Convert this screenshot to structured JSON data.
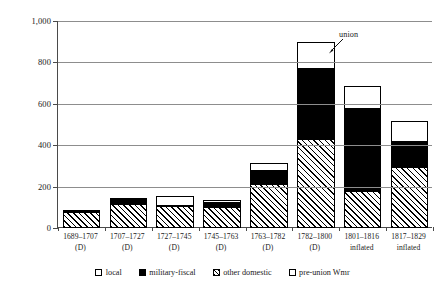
{
  "chart_data": {
    "type": "bar",
    "stacked": true,
    "title": "",
    "xlabel": "",
    "ylabel": "",
    "ylim": [
      0,
      1000
    ],
    "yticks": [
      0,
      200,
      400,
      600,
      800,
      1000
    ],
    "ytick_labels": [
      "0",
      "200",
      "400",
      "600",
      "800",
      "1,000"
    ],
    "grid": true,
    "legend_position": "bottom",
    "categories": [
      "1689–1707",
      "1707–1727",
      "1727–1745",
      "1745–1763",
      "1763–1782",
      "1782–1800",
      "1801–1816",
      "1817–1829"
    ],
    "category_sublabels": [
      "(D)",
      "(D)",
      "(D)",
      "(D)",
      "(D)",
      "(D)",
      "inflated",
      "inflated"
    ],
    "series": [
      {
        "name": "other domestic",
        "fill": "hatch",
        "values": [
          75,
          118,
          105,
          103,
          215,
          430,
          180,
          295
        ]
      },
      {
        "name": "military-fiscal",
        "fill": "black",
        "values": [
          12,
          30,
          13,
          27,
          72,
          350,
          405,
          128
        ]
      },
      {
        "name": "local",
        "fill": "white",
        "values": [
          10,
          0,
          45,
          13,
          35,
          130,
          110,
          102
        ]
      }
    ],
    "totals": [
      97,
      148,
      163,
      143,
      322,
      910,
      695,
      525
    ],
    "annotations": [
      {
        "text": "union",
        "target_category": "1801–1816"
      }
    ]
  },
  "legend": {
    "items": [
      {
        "label": "local",
        "fill": "white"
      },
      {
        "label": "military-fiscal",
        "fill": "black"
      },
      {
        "label": "other domestic",
        "fill": "hatch"
      },
      {
        "label": "pre-union Wmr",
        "fill": "white"
      }
    ]
  }
}
